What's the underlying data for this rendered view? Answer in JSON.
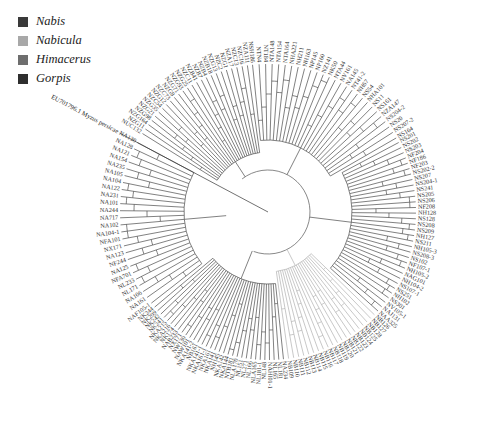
{
  "legend": {
    "items": [
      {
        "label": "Nabis",
        "color": "#3a3a3a"
      },
      {
        "label": "Nabicula",
        "color": "#a8a8a8"
      },
      {
        "label": "Himacerus",
        "color": "#6e6e6e"
      },
      {
        "label": "Gorpis",
        "color": "#2e2e2e"
      }
    ]
  },
  "tree": {
    "center": [
      268,
      212
    ],
    "outgroup": {
      "label": "EU701796.1 Myzus persicae",
      "angle": -152
    },
    "clades": [
      {
        "name": "upper-left",
        "color": "#4a4a4a",
        "start_angle": -148,
        "end_angle": -98,
        "leaves": [
          "NUC132",
          "NZG11",
          "NZG164",
          "NZG98",
          "NZG21",
          "NZG35",
          "NZC54",
          "NZG12",
          "NZC73",
          "NZG8",
          "NZG71",
          "NZG93",
          "NZG25",
          "NZC11",
          "NZB41",
          "NZB7",
          "NZB4",
          "NZB18",
          "NZG13",
          "NZC2",
          "NZG1",
          "NZA17",
          "NZC13",
          "NZC16",
          "NZA111"
        ]
      },
      {
        "name": "upper-right",
        "color": "#4a4a4a",
        "start_angle": -96,
        "end_angle": -30,
        "leaves": [
          "NSH186",
          "NTN4",
          "NT184",
          "NTA148",
          "NTA154",
          "NTA164",
          "NHA221",
          "NH211",
          "NH163",
          "NP145",
          "NP160",
          "NZ141",
          "NK50",
          "NTA44",
          "NV161",
          "NA145",
          "NT41-2",
          "NH67",
          "NS54",
          "NHA101",
          "NS11",
          "NS161",
          "NZA147",
          "NS204-2",
          "NS20",
          "NS207-2",
          "NS164"
        ]
      },
      {
        "name": "right",
        "color": "#4a4a4a",
        "start_angle": -28,
        "end_angle": 42,
        "leaves": [
          "NS201",
          "NS202",
          "NS203",
          "NF204",
          "NF186",
          "NF203",
          "NS202-2",
          "NS207",
          "NS204-1",
          "NS241",
          "NS205",
          "NS206",
          "NF208",
          "NH128",
          "NS128",
          "NS208",
          "NS209",
          "NH127",
          "NS211",
          "NH105-3",
          "NS208-3",
          "NS102",
          "NF107-1",
          "NH105-2",
          "NAG101",
          "NH104-2",
          "NS107-1",
          "NS251",
          "NH102",
          "NS301",
          "NV105-1",
          "NAJ131",
          "NAA325"
        ]
      },
      {
        "name": "lower-right-gray",
        "color": "#b0b0b0",
        "start_angle": 44,
        "end_angle": 82,
        "leaves": [
          "NB126",
          "NB127",
          "NB128",
          "NB125",
          "NB124",
          "NB123",
          "NB122",
          "NB121",
          "NB120",
          "NB119",
          "NB118",
          "NB117",
          "NB116",
          "NB115",
          "NB114",
          "NB113",
          "NB112",
          "NB111",
          "NB110",
          "NB109"
        ]
      },
      {
        "name": "bottom",
        "color": "#4a4a4a",
        "start_angle": 84,
        "end_angle": 140,
        "leaves": [
          "NA234",
          "NL181",
          "NL165",
          "NAHI01-1",
          "NL148",
          "NL181-1",
          "NLA165",
          "NL166",
          "NL271",
          "NL151",
          "NLA170",
          "NTB181",
          "NKA144",
          "NKA142",
          "NH145",
          "NKA141",
          "NKA161",
          "NKA161-1",
          "NKA141-1",
          "NB161",
          "NKA141-2",
          "NAW101",
          "NW130",
          "NX171",
          "NAB233",
          "NK174",
          "NKA216",
          "NKA215",
          "NK241",
          "NK242",
          "NK209",
          "NK244"
        ]
      },
      {
        "name": "left",
        "color": "#4a4a4a",
        "start_angle": 142,
        "end_angle": 208,
        "leaves": [
          "NAF105-1",
          "NA161",
          "NA106",
          "NL171",
          "NL233",
          "NFA701",
          "NA125",
          "NF244",
          "NA123",
          "NX171",
          "NFA101",
          "NA104-1",
          "NA102",
          "NA717",
          "NA244",
          "NA101",
          "NA231",
          "NA122",
          "NA104",
          "NA105",
          "NA235",
          "NA154",
          "NA121",
          "NA128",
          "NA130"
        ]
      }
    ]
  }
}
